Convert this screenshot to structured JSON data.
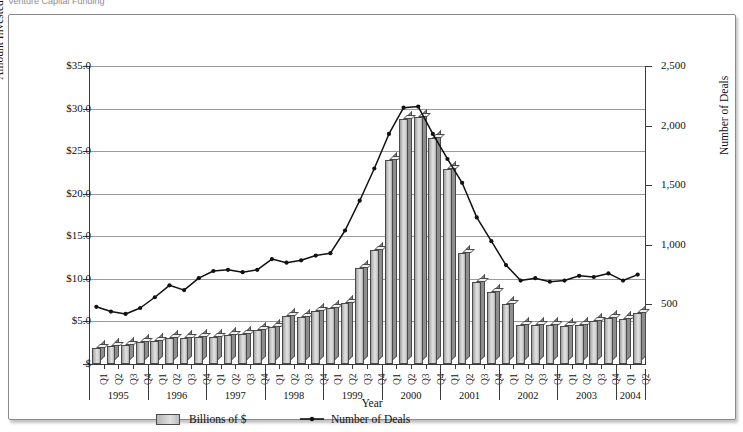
{
  "caption": "Venture Capital Funding",
  "axes": {
    "left_title": "Amount Invested (in billions of $)",
    "right_title": "Number of Deals",
    "x_title": "Year",
    "left_ticks": [
      "$35.0",
      "$30.0",
      "$25.0",
      "$20.0",
      "$15.0",
      "$10.0",
      "$5.0",
      "$"
    ],
    "right_ticks": [
      "2,500",
      "2,000",
      "1,500",
      "1,000",
      "500"
    ]
  },
  "legend": {
    "bars_label": "Billions of $",
    "line_label": "Number of Deals",
    "bar_swatch_icon": "bar-swatch-icon",
    "line_swatch_icon": "line-marker-icon"
  },
  "years": [
    {
      "year": "1995",
      "quarters": [
        "Q1",
        "Q2",
        "Q3",
        "Q4"
      ]
    },
    {
      "year": "1996",
      "quarters": [
        "Q1",
        "Q2",
        "Q3",
        "Q4"
      ]
    },
    {
      "year": "1997",
      "quarters": [
        "Q1",
        "Q2",
        "Q3",
        "Q4"
      ]
    },
    {
      "year": "1998",
      "quarters": [
        "Q1",
        "Q2",
        "Q3",
        "Q4"
      ]
    },
    {
      "year": "1999",
      "quarters": [
        "Q1",
        "Q2",
        "Q3",
        "Q4"
      ]
    },
    {
      "year": "2000",
      "quarters": [
        "Q1",
        "Q2",
        "Q3",
        "Q4"
      ]
    },
    {
      "year": "2001",
      "quarters": [
        "Q1",
        "Q2",
        "Q3",
        "Q4"
      ]
    },
    {
      "year": "2002",
      "quarters": [
        "Q1",
        "Q2",
        "Q3",
        "Q4"
      ]
    },
    {
      "year": "2003",
      "quarters": [
        "Q1",
        "Q2",
        "Q3",
        "Q4"
      ]
    },
    {
      "year": "2004",
      "quarters": [
        "Q1",
        "Q2"
      ]
    }
  ],
  "colors": {
    "bar_fill": "#d2d2d2",
    "bar_edge": "#4a4a4a",
    "line": "#111111",
    "grid": "#9a9a9a",
    "axis": "#3a3a3a",
    "panel_border": "#8a8a8a"
  },
  "chart_data": {
    "type": "bar",
    "title": "Venture Capital Funding",
    "xlabel": "Year",
    "ylabel": "Amount Invested (in billions of $)",
    "y2label": "Number of Deals",
    "ylim": [
      0,
      35
    ],
    "y2lim": [
      0,
      2500
    ],
    "grid": true,
    "legend_position": "bottom",
    "categories": [
      "1995 Q1",
      "1995 Q2",
      "1995 Q3",
      "1995 Q4",
      "1996 Q1",
      "1996 Q2",
      "1996 Q3",
      "1996 Q4",
      "1997 Q1",
      "1997 Q2",
      "1997 Q3",
      "1997 Q4",
      "1998 Q1",
      "1998 Q2",
      "1998 Q3",
      "1998 Q4",
      "1999 Q1",
      "1999 Q2",
      "1999 Q3",
      "1999 Q4",
      "2000 Q1",
      "2000 Q2",
      "2000 Q3",
      "2000 Q4",
      "2001 Q1",
      "2001 Q2",
      "2001 Q3",
      "2001 Q4",
      "2002 Q1",
      "2002 Q2",
      "2002 Q3",
      "2002 Q4",
      "2003 Q1",
      "2003 Q2",
      "2003 Q3",
      "2003 Q4",
      "2004 Q1",
      "2004 Q2"
    ],
    "series": [
      {
        "name": "Billions of $",
        "type": "bar",
        "axis": "left",
        "unit": "billions of $",
        "values": [
          1.9,
          2.1,
          2.2,
          2.6,
          2.7,
          3.0,
          3.1,
          3.2,
          3.2,
          3.4,
          3.5,
          4.0,
          4.3,
          5.6,
          5.5,
          6.2,
          6.6,
          7.2,
          11.3,
          13.4,
          24.0,
          28.8,
          29.0,
          26.6,
          22.9,
          13.0,
          9.6,
          8.5,
          7.0,
          4.6,
          4.6,
          4.6,
          4.5,
          4.6,
          5.0,
          5.4,
          5.3,
          6.0
        ]
      },
      {
        "name": "Number of Deals",
        "type": "line",
        "axis": "right",
        "unit": "deals",
        "values": [
          480,
          440,
          420,
          470,
          560,
          660,
          620,
          720,
          780,
          790,
          770,
          790,
          880,
          850,
          870,
          910,
          930,
          1120,
          1370,
          1640,
          1930,
          2150,
          2160,
          1930,
          1720,
          1520,
          1230,
          1030,
          830,
          700,
          720,
          690,
          700,
          740,
          730,
          760,
          700,
          750
        ]
      }
    ]
  }
}
